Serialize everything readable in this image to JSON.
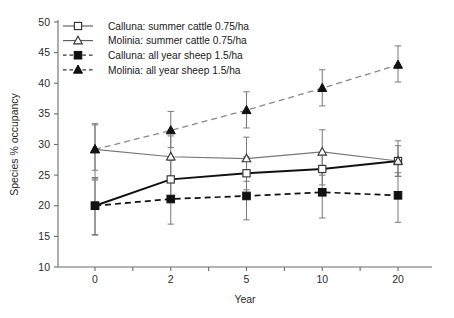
{
  "chart_data": {
    "type": "line",
    "title": "",
    "xlabel": "Year",
    "ylabel": "Species % occupancy",
    "categories": [
      "0",
      "2",
      "5",
      "10",
      "20"
    ],
    "x_tick_labels": [
      "0",
      "2",
      "5",
      "10",
      "20"
    ],
    "y_tick_labels": [
      "10",
      "15",
      "20",
      "25",
      "30",
      "35",
      "40",
      "45",
      "50"
    ],
    "y_ticks": [
      10,
      15,
      20,
      25,
      30,
      35,
      40,
      45,
      50
    ],
    "ylim": [
      10,
      50
    ],
    "grid": false,
    "legend_position": "top-left inside",
    "series": [
      {
        "name": "Calluna: summer cattle 0.75/ha",
        "marker": "open-square",
        "line": "solid",
        "color": "#333333",
        "values": [
          20.0,
          24.3,
          25.3,
          26.0,
          27.3
        ],
        "err_low": [
          15.3,
          21.2,
          22.6,
          23.4,
          24.8
        ],
        "err_high": [
          24.6,
          27.4,
          28.0,
          28.6,
          29.8
        ]
      },
      {
        "name": "Molinia: summer cattle 0.75/ha",
        "marker": "open-triangle",
        "line": "solid",
        "color": "#777777",
        "values": [
          29.2,
          28.0,
          27.7,
          28.8,
          27.3
        ],
        "err_low": [
          24.4,
          24.2,
          24.0,
          25.0,
          24.8
        ],
        "err_high": [
          33.4,
          31.4,
          31.2,
          32.4,
          30.6
        ]
      },
      {
        "name": "Calluna: all year sheep 1.5/ha",
        "marker": "filled-square",
        "line": "dashed",
        "color": "#111111",
        "values": [
          20.0,
          21.1,
          21.6,
          22.2,
          21.7
        ],
        "err_low": [
          15.2,
          17.0,
          17.7,
          18.0,
          17.3
        ],
        "err_high": [
          24.2,
          24.8,
          25.2,
          25.9,
          25.4
        ]
      },
      {
        "name": "Molinia: all year sheep 1.5/ha",
        "marker": "filled-triangle",
        "line": "dashed",
        "color": "#111111",
        "values": [
          29.2,
          32.3,
          35.6,
          39.2,
          43.0
        ],
        "err_low": [
          25.8,
          29.5,
          32.7,
          36.3,
          40.2
        ],
        "err_high": [
          33.2,
          35.4,
          38.6,
          42.2,
          46.1
        ]
      }
    ]
  },
  "legend": {
    "entries": [
      {
        "label": "Calluna: summer cattle 0.75/ha"
      },
      {
        "label": "Molinia: summer cattle 0.75/ha"
      },
      {
        "label": "Calluna: all year sheep 1.5/ha"
      },
      {
        "label": "Molinia: all year sheep 1.5/ha"
      }
    ]
  },
  "axes": {
    "x_title": "Year",
    "y_title": "Species % occupancy"
  }
}
